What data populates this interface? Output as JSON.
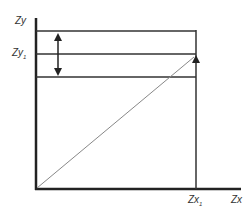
{
  "diagram": {
    "y_axis_label": "Zy",
    "y_tick_label": "Zy",
    "y_tick_sub": "1",
    "x_axis_label": "Zx",
    "x_tick_label": "Zx",
    "x_tick_sub": "1",
    "colors": {
      "axis": "#222222",
      "line": "#333333",
      "diagonal": "#888888"
    }
  }
}
